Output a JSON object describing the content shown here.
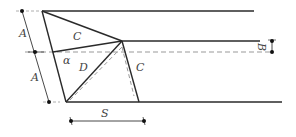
{
  "diagram": {
    "labels": {
      "A_upper": "A",
      "A_lower": "A",
      "C_upper": "C",
      "C_right": "C",
      "D": "D",
      "alpha": "α",
      "S": "S",
      "B": "B"
    },
    "colors": {
      "line": "#2a2a2a",
      "dashed": "#999999",
      "text": "#444444"
    }
  }
}
